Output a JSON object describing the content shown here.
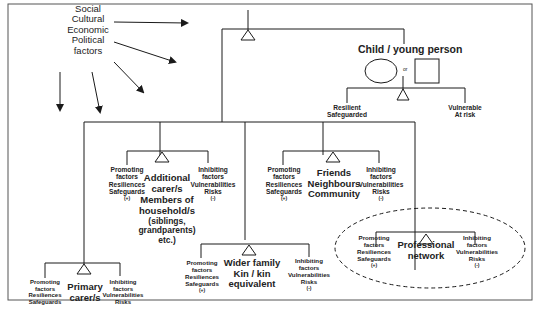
{
  "diagram": {
    "external_factors": {
      "lines": [
        "Social",
        "Cultural",
        "Economic",
        "Political",
        "factors"
      ]
    },
    "child": {
      "title": "Child / young person",
      "or_label": "or",
      "outcome_left": [
        "Resilient",
        "Safeguarded"
      ],
      "outcome_right": [
        "Vulnerable",
        "At risk"
      ]
    },
    "promoting": {
      "lines": [
        "Promoting",
        "factors",
        "Resiliences",
        "Safeguards"
      ],
      "sign": "(+)"
    },
    "inhibiting": {
      "lines": [
        "Inhibiting",
        "factors",
        "Vulnerabilities",
        "Risks"
      ],
      "sign": "(-)"
    },
    "nodes": [
      {
        "id": "primary",
        "label": [
          "Primary",
          "carer/s"
        ]
      },
      {
        "id": "additional",
        "label": [
          "Additional",
          "carer/s",
          "Members of",
          "household/s",
          "(siblings,",
          "grandparents)",
          "etc.)"
        ]
      },
      {
        "id": "wider",
        "label": [
          "Wider family",
          "Kin / kin",
          "equivalent"
        ]
      },
      {
        "id": "friends",
        "label": [
          "Friends",
          "Neighbours",
          "Community"
        ]
      },
      {
        "id": "professional",
        "label": [
          "Professional",
          "network"
        ]
      }
    ],
    "colors": {
      "line": "#2a2a2a",
      "text": "#1a1a1a",
      "background": "#ffffff"
    }
  }
}
